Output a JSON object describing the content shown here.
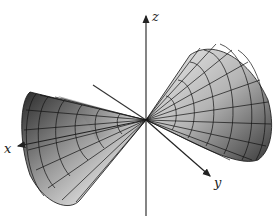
{
  "figure": {
    "axes": {
      "x_label": "x",
      "y_label": "y",
      "z_label": "z"
    },
    "colors": {
      "surface_light": "#e6e6e6",
      "surface_dark": "#1e1e1e",
      "mesh": "#111111",
      "axis": "#222222"
    }
  }
}
